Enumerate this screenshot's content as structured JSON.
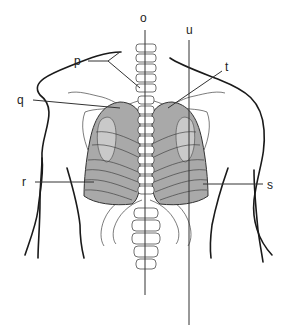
{
  "diagram": {
    "labels": [
      {
        "id": "o",
        "text": "o",
        "x": 143,
        "y": 22
      },
      {
        "id": "p",
        "text": "p",
        "x": 75,
        "y": 65
      },
      {
        "id": "q",
        "text": "q",
        "x": 18,
        "y": 104
      },
      {
        "id": "r",
        "text": "r",
        "x": 22,
        "y": 186
      },
      {
        "id": "s",
        "text": "s",
        "x": 268,
        "y": 189
      },
      {
        "id": "t",
        "text": "t",
        "x": 226,
        "y": 71
      },
      {
        "id": "u",
        "text": "u",
        "x": 187,
        "y": 34
      }
    ],
    "colors": {
      "lung_fill": "#a9a9a9",
      "lobe_fill": "#c9c9c9",
      "outline": "#1a1a1a",
      "background": "#ffffff"
    }
  }
}
